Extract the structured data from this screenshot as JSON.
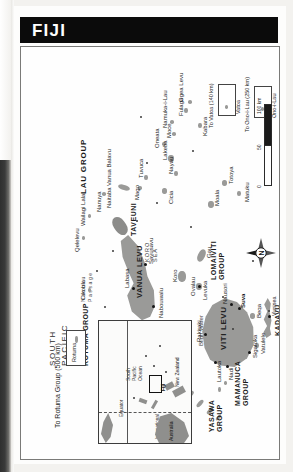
{
  "page": {
    "title": "FIJI",
    "orientation_note": "map printed rotated 90 degrees on page"
  },
  "map": {
    "seas": [
      {
        "name": "SOUTH PACIFIC OCEAN",
        "lines": [
          "SOUTH",
          "PACIFIC",
          "OCEAN"
        ]
      },
      {
        "name": "KORO SEA",
        "lines": [
          "KORO",
          "SEA"
        ]
      },
      {
        "name": "Bligh Water",
        "lines": [
          "Bligh Water"
        ]
      },
      {
        "name": "Nanuku Passage",
        "lines": [
          "Nanuku",
          "Passage"
        ]
      }
    ],
    "island_groups": [
      {
        "label": "LAU GROUP"
      },
      {
        "label": "ROTUMA GROUP"
      },
      {
        "label": "LOMAIVITI GROUP"
      },
      {
        "label": "YASAWA GROUP"
      },
      {
        "label": "MAMANUCA GROUP"
      },
      {
        "label": "KADAVU GROUP"
      }
    ],
    "major_islands": [
      {
        "label": "VITI LEVU"
      },
      {
        "label": "VANUA LEVU"
      },
      {
        "label": "TAVEUNI"
      }
    ],
    "islands": [
      {
        "label": "Cikobia"
      },
      {
        "label": "Nanuya"
      },
      {
        "label": "Qelelevu"
      },
      {
        "label": "Wailagi Lala"
      },
      {
        "label": "Naitaba"
      },
      {
        "label": "Vanua Balavu"
      },
      {
        "label": "Mago"
      },
      {
        "label": "Tuvuca"
      },
      {
        "label": "Cicia"
      },
      {
        "label": "Nayau"
      },
      {
        "label": "Lakeba"
      },
      {
        "label": "Oneata"
      },
      {
        "label": "Moce"
      },
      {
        "label": "Namuka-i-Lau"
      },
      {
        "label": "Fulaga"
      },
      {
        "label": "Ogea Levu"
      },
      {
        "label": "Kabara"
      },
      {
        "label": "Moala"
      },
      {
        "label": "Totoya"
      },
      {
        "label": "Matuku"
      },
      {
        "label": "Koro"
      },
      {
        "label": "Gau"
      },
      {
        "label": "Ovalau"
      },
      {
        "label": "Beqa"
      },
      {
        "label": "Vatulele"
      },
      {
        "label": "Yasawa"
      }
    ],
    "cities": [
      {
        "label": "Labasa"
      },
      {
        "label": "Savusavu"
      },
      {
        "label": "Nabouwalu"
      },
      {
        "label": "Rakiraki"
      },
      {
        "label": "Lautoka"
      },
      {
        "label": "Nadi"
      },
      {
        "label": "Sigatoka"
      },
      {
        "label": "Suva"
      },
      {
        "label": "Nausori"
      },
      {
        "label": "Levuka"
      },
      {
        "label": "Vunisea"
      }
    ],
    "callouts": [
      {
        "label": "To Rotuma Group (500 km)"
      },
      {
        "label": "To Vatoa (140 km)"
      },
      {
        "label": "To Ono-i-Lau (250 km)"
      },
      {
        "label": "Ono-i-Lau"
      },
      {
        "label": "Vatoa"
      },
      {
        "label": "Rotuma"
      }
    ],
    "scale": {
      "ticks": [
        "0",
        "50",
        "100 km"
      ],
      "unit": "km"
    },
    "compass": {
      "north_label": "N"
    },
    "inset": {
      "labels": [
        "Equator",
        "International Date Line",
        "South Pacific Ocean",
        "Australia",
        "New Zealand",
        "Fiji"
      ]
    }
  },
  "colors": {
    "title_bar": "#0b0b0b",
    "title_text": "#ffffff",
    "land": "#9a9a98",
    "paper": "#fdfdfc",
    "ink": "#1d1d1d",
    "gutter": "#2f2f2f"
  }
}
